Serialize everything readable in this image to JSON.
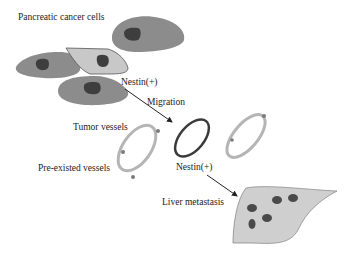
{
  "figure": {
    "labels": {
      "cancer_cells": "Pancreatic cancer cells",
      "nestin_top": "Nestin(+)",
      "migration": "Migration",
      "tumor_vessels": "Tumor vessels",
      "preexisted_vessels": "Pre-existed vessels",
      "nestin_vessel": "Nestin(+)",
      "liver_metastasis": "Liver metastasis"
    },
    "colors": {
      "cell_fill": "#8c8c8c",
      "cell_nucleus": "#3e3e3e",
      "nestin_cell_fill": "#c8c8c8",
      "vessel_stroke": "#a9a9a9",
      "nestin_vessel_stroke": "#3a3a3a",
      "liver_fill": "#cfcfcf",
      "liver_outline": "#8a8a8a",
      "metastasis_spot": "#4a4a4a",
      "arrow": "#222222"
    }
  }
}
